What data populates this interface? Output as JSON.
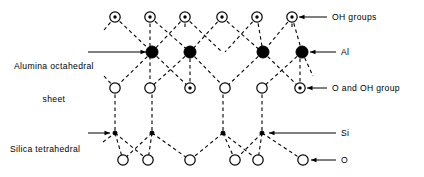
{
  "figure": {
    "type": "structural-diagram",
    "width": 424,
    "height": 177,
    "background_color": "#ffffff",
    "line_color": "#000000",
    "atom_fill_color": "#000000",
    "atom_open_color": "#ffffff"
  },
  "labels": {
    "alumina_sheet": {
      "line1": "Alumina octahedral",
      "line2": "sheet"
    },
    "silica_sheet": {
      "line1": "Silica tetrahedral",
      "line2": "sheet"
    },
    "oh_groups": "OH groups",
    "al": "Al",
    "o_and_oh_group": "O and OH group",
    "si": "Si",
    "o": "O"
  },
  "legend": [
    {
      "symbol": "circle-with-center-dot",
      "meaning": "OH groups"
    },
    {
      "symbol": "filled-circle-large",
      "meaning": "Al"
    },
    {
      "symbol": "open-circle",
      "meaning": "O"
    },
    {
      "symbol": "circle-with-center-dot",
      "meaning": "O and OH group"
    },
    {
      "symbol": "filled-dot-small",
      "meaning": "Si"
    }
  ],
  "rows": [
    {
      "id": "row-oh-top",
      "name": "OH groups row",
      "y": 17,
      "marker": "circle-with-center-dot",
      "radius": 5.2,
      "atoms": [
        {
          "x": 115,
          "dot": true
        },
        {
          "x": 150,
          "dot": true
        },
        {
          "x": 185,
          "dot": true
        },
        {
          "x": 222,
          "dot": true
        },
        {
          "x": 257,
          "dot": true
        },
        {
          "x": 292,
          "dot": true
        }
      ]
    },
    {
      "id": "row-al",
      "name": "Aluminium row",
      "y": 52,
      "marker": "filled-circle-large",
      "radius": 6.0,
      "atoms": [
        {
          "x": 152
        },
        {
          "x": 190
        },
        {
          "x": 263
        },
        {
          "x": 302
        }
      ]
    },
    {
      "id": "row-o-oh-mid",
      "name": "O and OH group row",
      "y": 88,
      "marker": "open-circle",
      "radius": 5.2,
      "atoms": [
        {
          "x": 115,
          "dot": false
        },
        {
          "x": 150,
          "dot": false
        },
        {
          "x": 190,
          "dot": true
        },
        {
          "x": 225,
          "dot": false
        },
        {
          "x": 262,
          "dot": false
        },
        {
          "x": 300,
          "dot": true
        }
      ]
    },
    {
      "id": "row-si",
      "name": "Silicon row",
      "y": 133,
      "marker": "filled-dot-small",
      "radius": 2.0,
      "atoms": [
        {
          "x": 115
        },
        {
          "x": 152
        },
        {
          "x": 223
        },
        {
          "x": 262
        }
      ]
    },
    {
      "id": "row-o-bottom",
      "name": "Oxygen row",
      "y": 160,
      "marker": "open-circle",
      "radius": 5.2,
      "atoms": [
        {
          "x": 123,
          "dot": false
        },
        {
          "x": 148,
          "dot": false
        },
        {
          "x": 190,
          "dot": false
        },
        {
          "x": 235,
          "dot": false
        },
        {
          "x": 258,
          "dot": false
        },
        {
          "x": 303,
          "dot": false
        }
      ]
    }
  ],
  "callouts": [
    {
      "id": "callout-alumina",
      "text_x": 14,
      "text_y": 39,
      "leader": {
        "x1": 88,
        "y1": 52,
        "x2": 146,
        "y2": 52,
        "arrow": "right"
      }
    },
    {
      "id": "callout-silica",
      "text_x": 10,
      "text_y": 122,
      "leader": {
        "x1": 88,
        "y1": 133,
        "x2": 110,
        "y2": 133,
        "arrow": "right"
      }
    },
    {
      "id": "callout-oh-groups",
      "text_x": 332,
      "text_y": 12,
      "leader": {
        "x1": 327,
        "y1": 17,
        "x2": 299,
        "y2": 17,
        "arrow": "left"
      }
    },
    {
      "id": "callout-al",
      "text_x": 341,
      "text_y": 47,
      "leader": {
        "x1": 336,
        "y1": 52,
        "x2": 310,
        "y2": 52,
        "arrow": "left"
      }
    },
    {
      "id": "callout-o-and-oh",
      "text_x": 332,
      "text_y": 83,
      "leader": {
        "x1": 327,
        "y1": 88,
        "x2": 307,
        "y2": 88,
        "arrow": "left"
      }
    },
    {
      "id": "callout-si",
      "text_x": 341,
      "text_y": 128,
      "leader": {
        "x1": 336,
        "y1": 133,
        "x2": 269,
        "y2": 133,
        "arrow": "left"
      }
    },
    {
      "id": "callout-o",
      "text_x": 341,
      "text_y": 155,
      "leader": {
        "x1": 336,
        "y1": 160,
        "x2": 311,
        "y2": 160,
        "arrow": "left"
      }
    }
  ],
  "bonds": {
    "style": "dashed",
    "dash_pattern": "3.5 3",
    "stroke_width": 1.1,
    "segments": [
      {
        "from": [
          104,
          30
        ],
        "to": [
          115,
          17
        ]
      },
      {
        "from": [
          115,
          17
        ],
        "to": [
          152,
          52
        ]
      },
      {
        "from": [
          150,
          17
        ],
        "to": [
          150,
          88
        ]
      },
      {
        "from": [
          185,
          17
        ],
        "to": [
          152,
          52
        ]
      },
      {
        "from": [
          185,
          17
        ],
        "to": [
          185,
          30
        ]
      },
      {
        "from": [
          150,
          17
        ],
        "to": [
          190,
          52
        ]
      },
      {
        "from": [
          185,
          17
        ],
        "to": [
          222,
          52
        ]
      },
      {
        "from": [
          222,
          17
        ],
        "to": [
          190,
          52
        ]
      },
      {
        "from": [
          222,
          17
        ],
        "to": [
          262,
          52
        ]
      },
      {
        "from": [
          257,
          17
        ],
        "to": [
          225,
          52
        ]
      },
      {
        "from": [
          257,
          17
        ],
        "to": [
          263,
          52
        ]
      },
      {
        "from": [
          292,
          17
        ],
        "to": [
          263,
          52
        ]
      },
      {
        "from": [
          292,
          17
        ],
        "to": [
          302,
          52
        ]
      },
      {
        "from": [
          292,
          17
        ],
        "to": [
          292,
          30
        ]
      },
      {
        "from": [
          152,
          52
        ],
        "to": [
          115,
          88
        ]
      },
      {
        "from": [
          152,
          52
        ],
        "to": [
          190,
          88
        ]
      },
      {
        "from": [
          190,
          52
        ],
        "to": [
          150,
          88
        ]
      },
      {
        "from": [
          190,
          52
        ],
        "to": [
          225,
          88
        ]
      },
      {
        "from": [
          263,
          52
        ],
        "to": [
          225,
          88
        ]
      },
      {
        "from": [
          263,
          52
        ],
        "to": [
          300,
          88
        ]
      },
      {
        "from": [
          302,
          52
        ],
        "to": [
          262,
          88
        ]
      },
      {
        "from": [
          302,
          52
        ],
        "to": [
          313,
          76
        ]
      },
      {
        "from": [
          104,
          76
        ],
        "to": [
          115,
          88
        ]
      },
      {
        "from": [
          190,
          88
        ],
        "to": [
          190,
          52
        ]
      },
      {
        "from": [
          300,
          88
        ],
        "to": [
          300,
          52
        ]
      },
      {
        "from": [
          115,
          88
        ],
        "to": [
          115,
          133
        ]
      },
      {
        "from": [
          152,
          88
        ],
        "to": [
          152,
          133
        ]
      },
      {
        "from": [
          223,
          88
        ],
        "to": [
          223,
          133
        ]
      },
      {
        "from": [
          262,
          88
        ],
        "to": [
          262,
          133
        ]
      },
      {
        "from": [
          103,
          142
        ],
        "to": [
          115,
          133
        ]
      },
      {
        "from": [
          115,
          133
        ],
        "to": [
          123,
          160
        ]
      },
      {
        "from": [
          115,
          133
        ],
        "to": [
          148,
          160
        ]
      },
      {
        "from": [
          152,
          133
        ],
        "to": [
          123,
          160
        ]
      },
      {
        "from": [
          152,
          133
        ],
        "to": [
          148,
          160
        ]
      },
      {
        "from": [
          152,
          133
        ],
        "to": [
          190,
          160
        ]
      },
      {
        "from": [
          223,
          133
        ],
        "to": [
          190,
          160
        ]
      },
      {
        "from": [
          223,
          133
        ],
        "to": [
          235,
          160
        ]
      },
      {
        "from": [
          223,
          133
        ],
        "to": [
          258,
          160
        ]
      },
      {
        "from": [
          262,
          133
        ],
        "to": [
          235,
          160
        ]
      },
      {
        "from": [
          262,
          133
        ],
        "to": [
          258,
          160
        ]
      },
      {
        "from": [
          262,
          133
        ],
        "to": [
          303,
          160
        ]
      }
    ]
  }
}
